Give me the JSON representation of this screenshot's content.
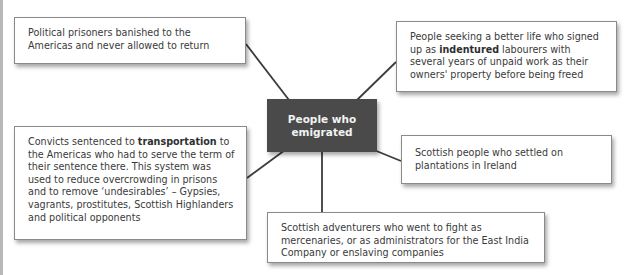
{
  "diagram": {
    "type": "spider",
    "center": {
      "label": "People who emigrated",
      "fill": "#4a4a4a",
      "text_color": "#f2f2f2"
    },
    "nodes": [
      {
        "id": "political-prisoners",
        "pre": "Political prisoners banished to the Americas and never allowed to return",
        "bold": "",
        "post": ""
      },
      {
        "id": "indentured-labourers",
        "pre": "People seeking a better life who signed up as ",
        "bold": "indentured",
        "post": " labourers with several years of unpaid work as their owners' property before being freed"
      },
      {
        "id": "convicts",
        "pre": "Convicts sentenced to ",
        "bold": "transportation",
        "post": " to the Americas who had to serve the term of their sentence there. This system was used to reduce overcrowding  in prisons and to remove ‘undesirables’ – Gypsies, vagrants, prostitutes, Scottish Highlanders  and political opponents"
      },
      {
        "id": "irish-plantations",
        "pre": "Scottish people who settled on plantations in Ireland",
        "bold": "",
        "post": ""
      },
      {
        "id": "adventurers",
        "pre": "Scottish adventurers who went to fight as mercenaries, or as administrators for the East India Company or enslaving companies",
        "bold": "",
        "post": ""
      }
    ],
    "colors": {
      "border": "#8a8a8a",
      "line": "#3c3c3c",
      "edge_bar": "#b8b8b8"
    }
  }
}
